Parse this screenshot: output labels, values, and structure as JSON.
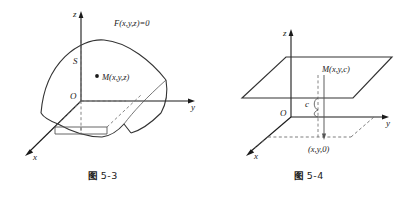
{
  "page": {
    "background_color": "#ffffff",
    "ink_color": "#1a1a1a",
    "width": 412,
    "height": 197
  },
  "figures": [
    {
      "id": "fig-5-3",
      "caption_label": "图",
      "caption_number": "5-3",
      "description": "Saddle-shaped surface S in 3D axes with point M(x,y,z) and implicit surface equation label",
      "axes": {
        "z_label": "z",
        "y_label": "y",
        "x_label": "x",
        "origin_label": "O"
      },
      "labels": {
        "surface_equation": "F(x,y,z)=0",
        "surface_name": "S",
        "point": "M(x,y,z)"
      }
    },
    {
      "id": "fig-5-4",
      "caption_label": "图",
      "caption_number": "5-4",
      "description": "Horizontal plane z = c with point M(x,y,c) projected down to (x,y,0) in the xOy plane",
      "axes": {
        "z_label": "z",
        "y_label": "y",
        "x_label": "x",
        "origin_label": "O"
      },
      "labels": {
        "point_on_plane": "M(x,y,c)",
        "height": "c",
        "projection_point": "(x,y,0)"
      }
    }
  ]
}
